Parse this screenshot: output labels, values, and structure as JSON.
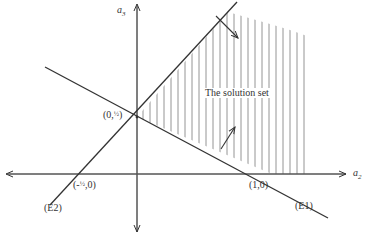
{
  "diagram": {
    "type": "linear-program-feasible-region",
    "axes": {
      "horizontal": {
        "label": "a",
        "subscript": "2"
      },
      "vertical": {
        "label": "a",
        "subscript": "3"
      }
    },
    "lines": [
      {
        "name": "(E1)",
        "through": [
          "(0,½)",
          "(1,0)"
        ]
      },
      {
        "name": "(E2)",
        "through": [
          "(-½,0)",
          "(0,½)"
        ]
      }
    ],
    "points": {
      "p_top": {
        "prefix": "(0,",
        "frac": "½",
        "suffix": ")"
      },
      "p_right": "(1,0)",
      "p_left": {
        "prefix": "(-",
        "frac": "½",
        "suffix": ",0)"
      }
    },
    "region_label": "The solution set",
    "colors": {
      "line": "#333333",
      "hatch": "#888888",
      "background": "#ffffff"
    }
  }
}
